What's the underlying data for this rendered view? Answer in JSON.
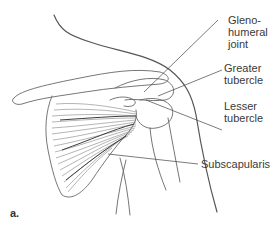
{
  "figure": {
    "panel_label": "a.",
    "labels": [
      {
        "id": "glenohumeral-joint",
        "lines": [
          "Gleno-",
          "humeral",
          "joint"
        ]
      },
      {
        "id": "greater-tubercle",
        "lines": [
          "Greater",
          "tubercle"
        ]
      },
      {
        "id": "lesser-tubercle",
        "lines": [
          "Lesser",
          "tubercle"
        ]
      },
      {
        "id": "subscapularis",
        "lines": [
          "Subscapularis"
        ]
      }
    ]
  },
  "colors": {
    "line": "#555555",
    "muscle": "#6a6a6a",
    "text": "#3a3a3a"
  }
}
